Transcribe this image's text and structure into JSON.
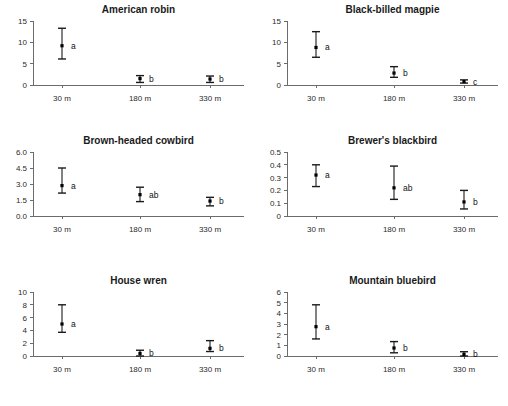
{
  "figure": {
    "panel_count": 6,
    "x_categories": [
      "30 m",
      "180 m",
      "330 m"
    ]
  },
  "chart_data": [
    {
      "type": "scatter",
      "title": "American robin",
      "xlabel": "",
      "ylabel": "",
      "categories": [
        "30 m",
        "180 m",
        "330 m"
      ],
      "values": [
        9.2,
        1.5,
        1.4
      ],
      "err_low": [
        6.1,
        0.6,
        0.6
      ],
      "err_high": [
        13.3,
        2.2,
        2.1
      ],
      "annotations": [
        "a",
        "b",
        "b"
      ],
      "yticks": [
        0,
        5,
        10,
        15
      ],
      "ytick_labels": [
        "0",
        "5",
        "10",
        "15"
      ],
      "ylim": [
        0,
        15
      ],
      "grid": false,
      "legend": "none"
    },
    {
      "type": "scatter",
      "title": "Black-billed magpie",
      "xlabel": "",
      "ylabel": "",
      "categories": [
        "30 m",
        "180 m",
        "330 m"
      ],
      "values": [
        8.8,
        2.8,
        0.8
      ],
      "err_low": [
        6.5,
        1.8,
        0.45
      ],
      "err_high": [
        12.5,
        4.3,
        1.2
      ],
      "annotations": [
        "a",
        "b",
        "c"
      ],
      "yticks": [
        0,
        5,
        10,
        15
      ],
      "ytick_labels": [
        "0",
        "5",
        "10",
        "15"
      ],
      "ylim": [
        0,
        15
      ],
      "grid": false,
      "legend": "none"
    },
    {
      "type": "scatter",
      "title": "Brown-headed cowbird",
      "xlabel": "",
      "ylabel": "",
      "categories": [
        "30 m",
        "180 m",
        "330 m"
      ],
      "values": [
        2.85,
        2.0,
        1.4
      ],
      "err_low": [
        2.15,
        1.35,
        0.95
      ],
      "err_high": [
        4.5,
        2.7,
        1.75
      ],
      "annotations": [
        "a",
        "ab",
        "b"
      ],
      "yticks": [
        0,
        1.5,
        3.0,
        4.5,
        6.0
      ],
      "ytick_labels": [
        "0.0",
        "1.5",
        "3.0",
        "4.5",
        "6.0"
      ],
      "ylim": [
        0,
        6
      ],
      "grid": false,
      "legend": "none"
    },
    {
      "type": "scatter",
      "title": "Brewer's blackbird",
      "xlabel": "",
      "ylabel": "",
      "categories": [
        "30 m",
        "180 m",
        "330 m"
      ],
      "values": [
        0.32,
        0.22,
        0.11
      ],
      "err_low": [
        0.23,
        0.13,
        0.055
      ],
      "err_high": [
        0.4,
        0.39,
        0.2
      ],
      "annotations": [
        "a",
        "ab",
        "b"
      ],
      "yticks": [
        0,
        0.1,
        0.2,
        0.3,
        0.4,
        0.5
      ],
      "ytick_labels": [
        "0",
        "0.1",
        "0.2",
        "0.3",
        "0.4",
        "0.5"
      ],
      "ylim": [
        0,
        0.5
      ],
      "grid": false,
      "legend": "none"
    },
    {
      "type": "scatter",
      "title": "House wren",
      "xlabel": "",
      "ylabel": "",
      "categories": [
        "30 m",
        "180 m",
        "330 m"
      ],
      "values": [
        5.0,
        0.4,
        1.2
      ],
      "err_low": [
        3.7,
        0.0,
        0.7
      ],
      "err_high": [
        8.0,
        0.9,
        2.4
      ],
      "annotations": [
        "a",
        "b",
        "b"
      ],
      "yticks": [
        0,
        2,
        4,
        6,
        8,
        10
      ],
      "ytick_labels": [
        "0",
        "2",
        "4",
        "6",
        "8",
        "10"
      ],
      "ylim": [
        0,
        10
      ],
      "grid": false,
      "legend": "none"
    },
    {
      "type": "scatter",
      "title": "Mountain bluebird",
      "xlabel": "",
      "ylabel": "",
      "categories": [
        "30 m",
        "180 m",
        "330 m"
      ],
      "values": [
        2.75,
        0.75,
        0.15
      ],
      "err_low": [
        1.6,
        0.3,
        0.0
      ],
      "err_high": [
        4.8,
        1.35,
        0.4
      ],
      "annotations": [
        "a",
        "b",
        "b"
      ],
      "yticks": [
        0,
        1,
        2,
        3,
        4,
        5,
        6
      ],
      "ytick_labels": [
        "0",
        "1",
        "2",
        "3",
        "4",
        "5",
        "6"
      ],
      "ylim": [
        0,
        6
      ],
      "grid": false,
      "legend": "none"
    }
  ],
  "colors": {
    "axis": "#6b6b6b",
    "marker": "#000000",
    "text": "#1a1a1a",
    "background": "#ffffff"
  }
}
